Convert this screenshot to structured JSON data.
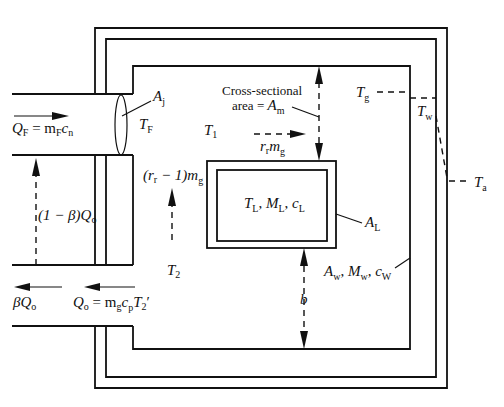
{
  "diagram": {
    "type": "furnace heat-balance schematic",
    "line_color": "#111111",
    "background": "#ffffff"
  },
  "labels": {
    "fuel_flow": {
      "main": "Q",
      "sub": "F",
      "eq": " = m",
      "sub2": "F",
      "tail": "c",
      "sub3": "n"
    },
    "jet_area": {
      "main": "A",
      "sub": "j"
    },
    "flame_temp": {
      "main": "T",
      "sub": "F"
    },
    "zone1_temp": {
      "main": "T",
      "sub": "1"
    },
    "cross_section_line1": "Cross-sectional",
    "cross_section_line2": "area = ",
    "cross_section_sym": {
      "main": "A",
      "sub": "m"
    },
    "recirc_right": {
      "main": "r",
      "sub": "r",
      "tail": "m",
      "sub2": "g"
    },
    "recirc_up": {
      "pre": "(r",
      "sub": "r",
      "mid": " − 1)m",
      "sub2": "g"
    },
    "load_props": "T_L, M_L, c_L",
    "load_props_parts": {
      "t": "T",
      "t_sub": "L",
      "m": "M",
      "m_sub": "L",
      "c": "c",
      "c_sub": "L"
    },
    "load_area": {
      "main": "A",
      "sub": "L"
    },
    "gas_temp": {
      "main": "T",
      "sub": "g"
    },
    "wall_temp": {
      "main": "T",
      "sub": "w"
    },
    "ambient_temp": {
      "main": "T",
      "sub": "a"
    },
    "wall_props": {
      "a": "A",
      "a_sub": "w",
      "m": "M",
      "m_sub": "w",
      "c": "c",
      "c_sub": "W"
    },
    "gap": "b",
    "zone2_temp": {
      "main": "T",
      "sub": "2"
    },
    "recuperated": {
      "pre": "(1 − β)Q",
      "sub": "o"
    },
    "bypass": {
      "pre": "βQ",
      "sub": "o"
    },
    "exhaust": {
      "main": "Q",
      "sub": "o",
      "eq": " = m",
      "sub2": "g",
      "c": "c",
      "sub3": "p",
      "t": "T",
      "sub4": "2",
      "prime": "′"
    }
  }
}
